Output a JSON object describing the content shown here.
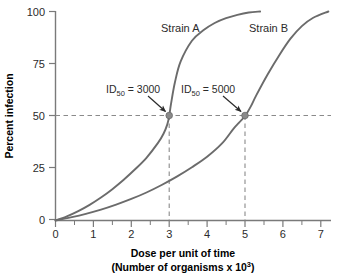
{
  "chart_data": {
    "type": "line",
    "title": "",
    "xlabel": "Dose per unit of time",
    "xlabel_line2": "(Number of organisms x 10³)",
    "ylabel": "Percent infection",
    "xlim": [
      0,
      7.3
    ],
    "ylim": [
      0,
      100
    ],
    "grid": false,
    "legend": "inline-curve-labels",
    "x_ticks": [
      "0",
      "1",
      "2",
      "3",
      "4",
      "5",
      "6",
      "7"
    ],
    "x_tick_values": [
      0,
      1,
      2,
      3,
      4,
      5,
      6,
      7
    ],
    "y_ticks": [
      "0",
      "25",
      "50",
      "75",
      "100"
    ],
    "y_tick_values": [
      0,
      25,
      50,
      75,
      100
    ],
    "series": [
      {
        "name": "Strain A",
        "color": "#6b6b6b",
        "x": [
          0.0,
          0.3,
          0.6,
          0.9,
          1.2,
          1.5,
          1.8,
          2.1,
          2.4,
          2.7,
          2.85,
          2.95,
          3.0,
          3.05,
          3.15,
          3.3,
          3.6,
          3.9,
          4.2,
          4.5,
          4.8,
          5.1,
          5.4
        ],
        "values": [
          0,
          2,
          4.5,
          7.5,
          11,
          15,
          19.5,
          24.5,
          30,
          37,
          41.5,
          46,
          50,
          56,
          66,
          76,
          86,
          91,
          94.5,
          96.8,
          98.4,
          99.5,
          100
        ]
      },
      {
        "name": "Strain B",
        "color": "#6b6b6b",
        "x": [
          0.0,
          0.4,
          0.8,
          1.2,
          1.6,
          2.0,
          2.4,
          2.8,
          3.2,
          3.6,
          4.0,
          4.4,
          4.7,
          4.85,
          5.0,
          5.15,
          5.3,
          5.6,
          5.9,
          6.2,
          6.5,
          6.8,
          7.2
        ],
        "values": [
          0,
          1.5,
          3.2,
          5.2,
          7.6,
          10.3,
          13.4,
          17.0,
          21.0,
          25.5,
          30.5,
          37.0,
          44.0,
          47.0,
          50,
          54.5,
          60.0,
          70.0,
          79.0,
          87.0,
          93.0,
          97.0,
          100
        ]
      }
    ],
    "markers": [
      {
        "name": "Strain A ID50",
        "x": 3,
        "y": 50,
        "color": "#8a8a8a"
      },
      {
        "name": "Strain B ID50",
        "x": 5,
        "y": 50,
        "color": "#8a8a8a"
      }
    ],
    "reference_lines": [
      {
        "name": "50 percent infection",
        "orientation": "horizontal",
        "value": 50,
        "style": "dashed"
      },
      {
        "name": "Strain A dose",
        "orientation": "vertical",
        "value": 3,
        "style": "dashed",
        "from": 0,
        "to": 50
      },
      {
        "name": "Strain B dose",
        "orientation": "vertical",
        "value": 5,
        "style": "dashed",
        "from": 0,
        "to": 50
      }
    ],
    "annotations": [
      {
        "name": "strain-a-id50",
        "prefix": "ID",
        "sub": "50",
        "suffix": " = 3000",
        "text": "ID50 = 3000",
        "points_to": [
          3,
          50
        ]
      },
      {
        "name": "strain-b-id50",
        "prefix": "ID",
        "sub": "50",
        "suffix": " = 5000",
        "text": "ID50 = 5000",
        "points_to": [
          5,
          50
        ]
      }
    ],
    "curve_labels": [
      {
        "name": "Strain A",
        "text": "Strain A"
      },
      {
        "name": "Strain B",
        "text": "Strain B"
      }
    ]
  },
  "labels": {
    "strain_a": "Strain A",
    "strain_b": "Strain B",
    "id50_a_prefix": "ID",
    "id50_a_sub": "50",
    "id50_a_suffix": " = 3000",
    "id50_b_prefix": "ID",
    "id50_b_sub": "50",
    "id50_b_suffix": " = 5000",
    "y_axis_title": "Percent infection",
    "x_axis_title_1": "Dose per unit of time",
    "x_axis_title_2a": "(Number of organisms x 10",
    "x_axis_title_2b": "3",
    "x_axis_title_2c": ")"
  },
  "ticks": {
    "y": [
      "100",
      "75",
      "50",
      "25",
      "0"
    ],
    "x": [
      "0",
      "1",
      "2",
      "3",
      "4",
      "5",
      "6",
      "7"
    ]
  },
  "colors": {
    "curve": "#6b6b6b",
    "axis": "#7a7a7a",
    "dash": "#8a8a8a",
    "text": "#2b2b2b",
    "marker": "#8a8a8a",
    "background": "#ffffff"
  }
}
